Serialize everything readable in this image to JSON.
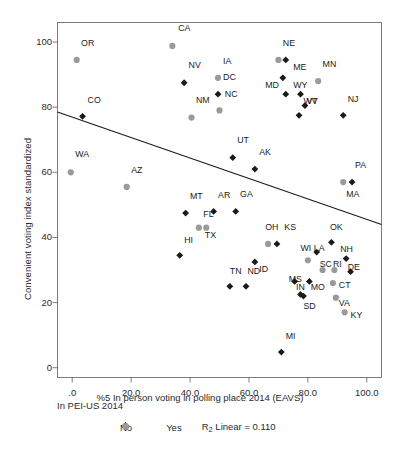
{
  "chart_data": {
    "type": "scatter",
    "title": "",
    "xlabel": "%5 In person voting in polling place 2014 (EAVS)",
    "ylabel": "Convenient voting index standardized",
    "xlim": [
      -5,
      105
    ],
    "ylim": [
      -3,
      106
    ],
    "xticks": [
      ".0",
      "20.0",
      "40.0",
      "60.0",
      "80.0",
      "100.0"
    ],
    "xtick_values": [
      0,
      20,
      40,
      60,
      80,
      100
    ],
    "yticks": [
      "0",
      "20",
      "40",
      "60",
      "80",
      "100"
    ],
    "ytick_values": [
      0,
      20,
      40,
      60,
      80,
      100
    ],
    "grid": false,
    "legend_title": "In PEI-US 2014",
    "legend_position": "bottom",
    "series": [
      {
        "name": "No",
        "marker": "diamond",
        "color": "#1a1a1a"
      },
      {
        "name": "Yes",
        "marker": "circle",
        "color": "#9a9a9a"
      }
    ],
    "fit_line": {
      "label": "R2 Linear = 0.110",
      "r2": 0.11,
      "x0": -5,
      "y0": 78.5,
      "x1": 105,
      "y1": 44.0
    },
    "points": [
      {
        "label": "OR",
        "x": 1.5,
        "y": 94.5,
        "group": "Yes",
        "lx": 3.0,
        "ly": 99.5
      },
      {
        "label": "CA",
        "x": 34.0,
        "y": 98.8,
        "group": "Yes",
        "lx": 36.0,
        "ly": 104.0
      },
      {
        "label": "CO",
        "x": 3.5,
        "y": 77.2,
        "group": "No",
        "lx": 5.2,
        "ly": 82.0
      },
      {
        "label": "WA",
        "x": -0.5,
        "y": 60.0,
        "group": "Yes",
        "lx": 1.0,
        "ly": 65.2
      },
      {
        "label": "AZ",
        "x": 18.5,
        "y": 55.5,
        "group": "Yes",
        "lx": 20.0,
        "ly": 60.5
      },
      {
        "label": "NV",
        "x": 38.0,
        "y": 87.5,
        "group": "No",
        "lx": 39.5,
        "ly": 92.5
      },
      {
        "label": "NM",
        "x": 40.5,
        "y": 76.8,
        "group": "Yes",
        "lx": 42.0,
        "ly": 81.8
      },
      {
        "label": "IA",
        "x": 49.5,
        "y": 89.0,
        "group": "Yes",
        "lx": 51.2,
        "ly": 94.0
      },
      {
        "label": "DC",
        "x": 49.5,
        "y": 84.0,
        "group": "No",
        "lx": 51.2,
        "ly": 89.0
      },
      {
        "label": "NC",
        "x": 50.0,
        "y": 79.0,
        "group": "Yes",
        "lx": 51.8,
        "ly": 83.8
      },
      {
        "label": "NE",
        "x": 70.0,
        "y": 94.5,
        "group": "Yes",
        "lx": 71.5,
        "ly": 99.5
      },
      {
        "label": "NE2",
        "x": 72.5,
        "y": 94.5,
        "group": "No",
        "lx": null,
        "ly": null
      },
      {
        "label": "ME",
        "x": 71.5,
        "y": 89.0,
        "group": "No",
        "lx": 75.0,
        "ly": 92.0
      },
      {
        "label": "MN",
        "x": 83.5,
        "y": 88.0,
        "group": "Yes",
        "lx": 85.0,
        "ly": 93.0
      },
      {
        "label": "MD",
        "x": 72.5,
        "y": 84.0,
        "group": "No",
        "lx": 65.5,
        "ly": 86.5
      },
      {
        "label": "WY",
        "x": 77.5,
        "y": 84.0,
        "group": "No",
        "lx": 75.0,
        "ly": 86.5
      },
      {
        "label": "VT",
        "x": 79.0,
        "y": 80.5,
        "group": "No",
        "lx": 79.5,
        "ly": 81.5
      },
      {
        "label": "WV",
        "x": 77.0,
        "y": 77.5,
        "group": "No",
        "lx": 78.5,
        "ly": 81.5
      },
      {
        "label": "NJ",
        "x": 92.0,
        "y": 77.5,
        "group": "No",
        "lx": 93.5,
        "ly": 82.2
      },
      {
        "label": "UT",
        "x": 54.5,
        "y": 64.5,
        "group": "No",
        "lx": 56.0,
        "ly": 69.5
      },
      {
        "label": "AK",
        "x": 62.0,
        "y": 61.0,
        "group": "No",
        "lx": 63.5,
        "ly": 66.0
      },
      {
        "label": "MA",
        "x": 92.0,
        "y": 57.0,
        "group": "Yes",
        "lx": 93.0,
        "ly": 53.0
      },
      {
        "label": "PA",
        "x": 95.0,
        "y": 57.0,
        "group": "No",
        "lx": 96.0,
        "ly": 62.0
      },
      {
        "label": "MT",
        "x": 38.5,
        "y": 47.5,
        "group": "No",
        "lx": 40.0,
        "ly": 52.5
      },
      {
        "label": "FL",
        "x": 43.0,
        "y": 43.0,
        "group": "Yes",
        "lx": 44.5,
        "ly": 47.0
      },
      {
        "label": "TX",
        "x": 45.5,
        "y": 43.0,
        "group": "Yes",
        "lx": 45.0,
        "ly": 40.5
      },
      {
        "label": "AR",
        "x": 48.0,
        "y": 48.0,
        "group": "No",
        "lx": 49.5,
        "ly": 52.8
      },
      {
        "label": "GA",
        "x": 55.5,
        "y": 48.0,
        "group": "No",
        "lx": 57.0,
        "ly": 53.0
      },
      {
        "label": "HI",
        "x": 36.5,
        "y": 34.5,
        "group": "No",
        "lx": 38.0,
        "ly": 39.0
      },
      {
        "label": "OH",
        "x": 66.5,
        "y": 38.0,
        "group": "Yes",
        "lx": 65.5,
        "ly": 42.8
      },
      {
        "label": "KS",
        "x": 69.5,
        "y": 38.0,
        "group": "No",
        "lx": 72.0,
        "ly": 42.8
      },
      {
        "label": "ID",
        "x": 62.0,
        "y": 32.5,
        "group": "No",
        "lx": 63.5,
        "ly": 30.0
      },
      {
        "label": "OK",
        "x": 88.0,
        "y": 38.5,
        "group": "No",
        "lx": 87.5,
        "ly": 43.0
      },
      {
        "label": "WI",
        "x": 80.0,
        "y": 33.0,
        "group": "Yes",
        "lx": 77.5,
        "ly": 36.5
      },
      {
        "label": "LA",
        "x": 83.0,
        "y": 35.5,
        "group": "No",
        "lx": 82.0,
        "ly": 36.5
      },
      {
        "label": "NH",
        "x": 93.0,
        "y": 33.5,
        "group": "No",
        "lx": 91.0,
        "ly": 36.0
      },
      {
        "label": "SC",
        "x": 85.0,
        "y": 30.0,
        "group": "Yes",
        "lx": 84.0,
        "ly": 31.5
      },
      {
        "label": "RI",
        "x": 89.0,
        "y": 30.0,
        "group": "Yes",
        "lx": 88.5,
        "ly": 31.5
      },
      {
        "label": "DE",
        "x": 94.5,
        "y": 29.5,
        "group": "No",
        "lx": 93.5,
        "ly": 30.5
      },
      {
        "label": "IN",
        "x": 75.5,
        "y": 26.5,
        "group": "No",
        "lx": 76.0,
        "ly": 24.5
      },
      {
        "label": "MO",
        "x": 80.5,
        "y": 26.5,
        "group": "No",
        "lx": 81.0,
        "ly": 24.5
      },
      {
        "label": "CT",
        "x": 88.5,
        "y": 26.0,
        "group": "Yes",
        "lx": 90.5,
        "ly": 25.0
      },
      {
        "label": "VA",
        "x": 89.5,
        "y": 21.5,
        "group": "Yes",
        "lx": 90.5,
        "ly": 19.5
      },
      {
        "label": "KY",
        "x": 92.5,
        "y": 17.0,
        "group": "Yes",
        "lx": 94.5,
        "ly": 16.0
      },
      {
        "label": "TN",
        "x": 53.5,
        "y": 25.0,
        "group": "No",
        "lx": 53.5,
        "ly": 29.5
      },
      {
        "label": "ND",
        "x": 59.0,
        "y": 25.0,
        "group": "No",
        "lx": 59.5,
        "ly": 29.5
      },
      {
        "label": "MS",
        "x": 77.5,
        "y": 22.5,
        "group": "No",
        "lx": 73.5,
        "ly": 27.0
      },
      {
        "label": "SD",
        "x": 78.5,
        "y": 22.0,
        "group": "No",
        "lx": 78.5,
        "ly": 18.5
      },
      {
        "label": "MI",
        "x": 71.0,
        "y": 4.8,
        "group": "No",
        "lx": 72.5,
        "ly": 9.5
      }
    ]
  }
}
